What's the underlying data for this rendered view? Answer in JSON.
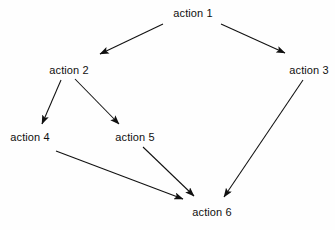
{
  "diagram": {
    "background_color": "#fefefe",
    "stroke_color": "#101010",
    "text_color": "#101010",
    "width": 335,
    "height": 230,
    "nodes": [
      {
        "id": "action1",
        "label": "action 1",
        "x": 193,
        "y": 13
      },
      {
        "id": "action2",
        "label": "action 2",
        "x": 69,
        "y": 70
      },
      {
        "id": "action3",
        "label": "action 3",
        "x": 309,
        "y": 70
      },
      {
        "id": "action4",
        "label": "action 4",
        "x": 30,
        "y": 137
      },
      {
        "id": "action5",
        "label": "action 5",
        "x": 135,
        "y": 137
      },
      {
        "id": "action6",
        "label": "action 6",
        "x": 212,
        "y": 212
      }
    ],
    "edges": [
      {
        "id": "e1",
        "from": "action 1",
        "to": "action 2",
        "x1": 163,
        "y1": 24,
        "x2": 100,
        "y2": 54
      },
      {
        "id": "e2",
        "from": "action 1",
        "to": "action 3",
        "x1": 221,
        "y1": 24,
        "x2": 285,
        "y2": 53
      },
      {
        "id": "e3",
        "from": "action 2",
        "to": "action 4",
        "x1": 61,
        "y1": 80,
        "x2": 42,
        "y2": 124
      },
      {
        "id": "e4",
        "from": "action 2",
        "to": "action 5",
        "x1": 75,
        "y1": 79,
        "x2": 119,
        "y2": 124
      },
      {
        "id": "e5",
        "from": "action 4",
        "to": "action 6",
        "x1": 56,
        "y1": 151,
        "x2": 183,
        "y2": 199
      },
      {
        "id": "e6",
        "from": "action 5",
        "to": "action 6",
        "x1": 143,
        "y1": 147,
        "x2": 194,
        "y2": 196
      },
      {
        "id": "e7",
        "from": "action 3",
        "to": "action 6",
        "x1": 303,
        "y1": 80,
        "x2": 224,
        "y2": 197
      }
    ]
  }
}
